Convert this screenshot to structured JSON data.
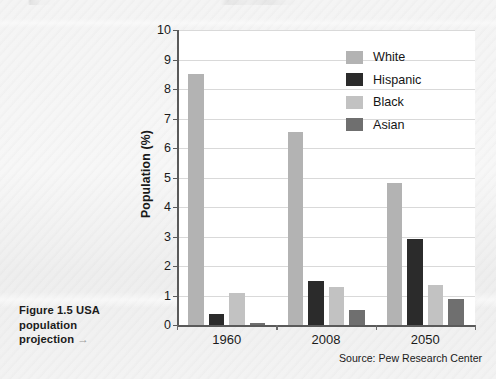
{
  "caption": {
    "line1": "Figure 1.5  USA",
    "line2": "population",
    "line3": "projection",
    "arrow": "→"
  },
  "source": "Source: Pew Research Center",
  "chart_data": {
    "type": "bar",
    "title": "",
    "xlabel": "",
    "ylabel": "Population (%)",
    "ylim": [
      0,
      10
    ],
    "yticks": [
      0,
      1,
      2,
      3,
      4,
      5,
      6,
      7,
      8,
      9,
      10
    ],
    "ytick_labels": [
      "0",
      "1",
      "2",
      "3",
      "4",
      "5",
      "6",
      "7",
      "8",
      "9",
      "10"
    ],
    "grid": true,
    "legend_position": "top-right",
    "categories": [
      "1960",
      "2008",
      "2050"
    ],
    "series": [
      {
        "name": "White",
        "color": "#b3b3b3",
        "values": [
          8.5,
          6.55,
          4.8
        ]
      },
      {
        "name": "Hispanic",
        "color": "#2b2b2b",
        "values": [
          0.38,
          1.5,
          2.93
        ]
      },
      {
        "name": "Black",
        "color": "#c2c2c2",
        "values": [
          1.1,
          1.3,
          1.35
        ]
      },
      {
        "name": "Asian",
        "color": "#6f6f6f",
        "values": [
          0.07,
          0.52,
          0.87
        ]
      }
    ]
  }
}
